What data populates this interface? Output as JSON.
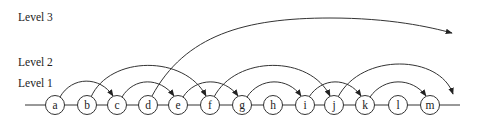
{
  "diagram": {
    "type": "skip-list-levels",
    "levels": [
      {
        "name": "level-3",
        "label": "Level 3",
        "x": 18,
        "y": 21
      },
      {
        "name": "level-2",
        "label": "Level 2",
        "x": 18,
        "y": 66
      },
      {
        "name": "level-1",
        "label": "Level 1",
        "x": 18,
        "y": 87
      }
    ],
    "baseline": {
      "x1": 25,
      "x2": 460,
      "y": 105
    },
    "node_radius": 9.5,
    "nodes": [
      {
        "id": "a",
        "label": "a",
        "x": 55
      },
      {
        "id": "b",
        "label": "b",
        "x": 87
      },
      {
        "id": "c",
        "label": "c",
        "x": 117
      },
      {
        "id": "d",
        "label": "d",
        "x": 148
      },
      {
        "id": "e",
        "label": "e",
        "x": 178
      },
      {
        "id": "f",
        "label": "f",
        "x": 210
      },
      {
        "id": "g",
        "label": "g",
        "x": 242
      },
      {
        "id": "h",
        "label": "h",
        "x": 273
      },
      {
        "id": "i",
        "label": "i",
        "x": 305
      },
      {
        "id": "j",
        "label": "j",
        "x": 334
      },
      {
        "id": "k",
        "label": "k",
        "x": 365
      },
      {
        "id": "l",
        "label": "l",
        "x": 398
      },
      {
        "id": "m",
        "label": "m",
        "x": 430
      }
    ],
    "edges": [
      {
        "level": 1,
        "from": "a",
        "to": "c",
        "path": "M60,97 C72,76 100,76 113,96"
      },
      {
        "level": 1,
        "from": "c",
        "to": "e",
        "path": "M122,97 C134,77 160,77 174,96"
      },
      {
        "level": 1,
        "from": "e",
        "to": "g",
        "path": "M183,97 C196,77 224,77 238,96"
      },
      {
        "level": 1,
        "from": "g",
        "to": "i",
        "path": "M247,97 C260,77 288,77 301,96"
      },
      {
        "level": 1,
        "from": "i",
        "to": "k",
        "path": "M309,97 C322,77 348,77 361,96"
      },
      {
        "level": 1,
        "from": "k",
        "to": "m",
        "path": "M370,97 C384,77 412,77 426,96"
      },
      {
        "level": 2,
        "from": "b",
        "to": "f",
        "path": "M91,97 C110,55 185,55 206,96"
      },
      {
        "level": 2,
        "from": "f",
        "to": "j",
        "path": "M214,97 C236,55 310,55 330,96"
      },
      {
        "level": 2,
        "from": "j",
        "to": "end",
        "path": "M338,97 C362,52 440,55 453,94"
      },
      {
        "level": 3,
        "from": "d",
        "to": "end",
        "path": "M152,96 C185,35 245,18 330,18 C390,18 430,27 452,33"
      }
    ],
    "colors": {
      "stroke": "#333333",
      "text": "#222222",
      "background": "#ffffff"
    }
  }
}
